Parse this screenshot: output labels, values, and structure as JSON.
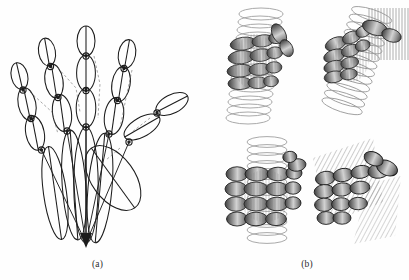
{
  "figure": {
    "type": "scientific-figure",
    "background_color": "#fefefe",
    "ink_color": "#1a1a1a",
    "width": 409,
    "height": 280,
    "panels": [
      {
        "id": "a",
        "caption": "(a)",
        "description": "Wireframe kinematic hand model built from elongated ellipses representing phalanges and metacarpals, all converging at a single wrist point.",
        "render_style": "line-drawing-ellipses",
        "digits": [
          {
            "name": "thumb",
            "segments": 3,
            "label": "thumb"
          },
          {
            "name": "index",
            "segments": 4,
            "label": "index"
          },
          {
            "name": "middle",
            "segments": 4,
            "label": "middle"
          },
          {
            "name": "ring",
            "segments": 4,
            "label": "ring"
          },
          {
            "name": "little",
            "segments": 4,
            "label": "little"
          }
        ],
        "joint_count": 16,
        "wrist_point": {
          "x": 86,
          "y": 243
        }
      },
      {
        "id": "b",
        "caption": "(b)",
        "description": "Four shaded grasp configurations of the hand model on primitive objects.",
        "render_style": "shaded-ellipsoids-with-wireframe-object",
        "subfigures": [
          {
            "index": 1,
            "position": "top-left",
            "object": "cylinder",
            "grasp": "cylindrical power grasp, frontal view",
            "object_render": "stacked elliptical rings"
          },
          {
            "index": 2,
            "position": "top-right",
            "object": "cylinder-and-plane",
            "grasp": "oblique power grasp with contact plane, tilted view",
            "object_render": "stacked elliptical rings plus vertical hatch plane"
          },
          {
            "index": 3,
            "position": "bottom-left",
            "object": "cylinder",
            "grasp": "four-finger wrap, side view",
            "object_render": "stacked elliptical rings"
          },
          {
            "index": 4,
            "position": "bottom-right",
            "object": "plane",
            "grasp": "planar grasp against hatched plate",
            "object_render": "diagonal hatch plane"
          }
        ]
      }
    ],
    "colors": {
      "stroke": "#1c1c1c",
      "fill_light": "#d8d8d8",
      "fill_mid": "#9a9a9a",
      "fill_dark": "#4a4a4a",
      "object_line": "#8a8a8a",
      "background": "#fefefe"
    }
  }
}
